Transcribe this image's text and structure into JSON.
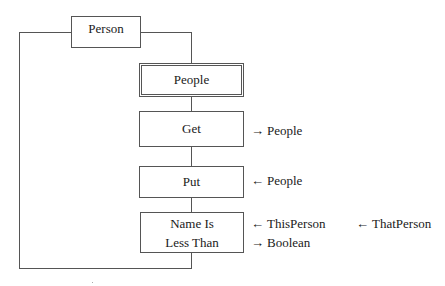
{
  "diagram": {
    "root": {
      "label": "Person"
    },
    "container": {
      "label": "People"
    },
    "operations": [
      {
        "label": "Get",
        "params": [
          {
            "direction": "out",
            "arrow": "→",
            "label": "People"
          }
        ]
      },
      {
        "label": "Put",
        "params": [
          {
            "direction": "in",
            "arrow": "←",
            "label": "People"
          }
        ]
      },
      {
        "label_lines": [
          "Name Is",
          "Less Than"
        ],
        "params": [
          {
            "direction": "in",
            "arrow": "←",
            "label": "ThisPerson"
          },
          {
            "direction": "in",
            "arrow": "←",
            "label": "ThatPerson"
          },
          {
            "direction": "out",
            "arrow": "→",
            "label": "Boolean"
          }
        ]
      }
    ]
  }
}
